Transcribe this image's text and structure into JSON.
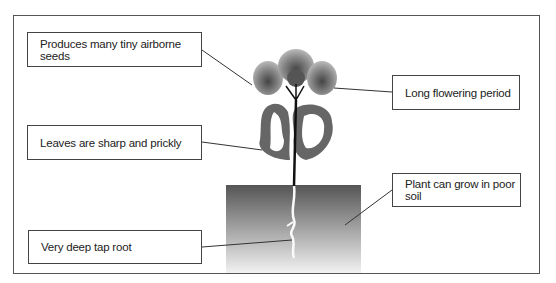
{
  "diagram": {
    "labels": [
      {
        "id": "seeds",
        "text": "Produces many tiny airborne seeds"
      },
      {
        "id": "leaves",
        "text": "Leaves are sharp and prickly"
      },
      {
        "id": "root",
        "text": "Very deep tap root"
      },
      {
        "id": "flowering",
        "text": "Long flowering period"
      },
      {
        "id": "soil",
        "text": "Plant can grow in poor soil"
      }
    ],
    "colors": {
      "frame": "#555555",
      "leader_line": "#333333",
      "soil_top": "#555555",
      "soil_bottom": "#f2f2f2",
      "flower": "#888888",
      "leaf": "#666666",
      "stem": "#111111"
    }
  }
}
